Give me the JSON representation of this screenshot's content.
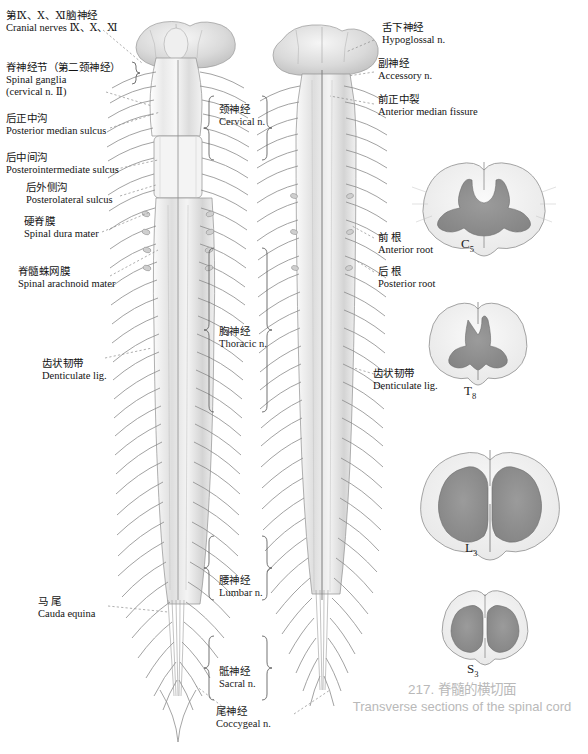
{
  "figure": {
    "caption_number_title_cn": "217. 脊髓的横切面",
    "caption_title_en": "Transverse sections of the spinal cord",
    "caption_color": "#b9b9b9"
  },
  "left_labels": [
    {
      "cn": "第Ⅸ、Ⅹ、Ⅺ脑神经",
      "en": "Cranial nerves Ⅸ、Ⅹ、Ⅺ"
    },
    {
      "cn": "脊神经节（第二颈神经）",
      "en": "Spinal ganglia",
      "en2": "(cervical n. Ⅱ)"
    },
    {
      "cn": "后正中沟",
      "en": "Posterior median sulcus"
    },
    {
      "cn": "后中间沟",
      "en": "Posterointermediate sulcus"
    },
    {
      "cn": "后外侧沟",
      "en": "Posterolateral sulcus"
    },
    {
      "cn": "硬脊膜",
      "en": "Spinal dura mater"
    },
    {
      "cn": "脊髓蛛网膜",
      "en": "Spinal arachnoid mater"
    },
    {
      "cn": "齿状韧带",
      "en": "Denticulate lig."
    },
    {
      "cn": "马  尾",
      "en": "Cauda equina"
    }
  ],
  "right_labels": [
    {
      "cn": "舌下神经",
      "en": "Hypoglossal n."
    },
    {
      "cn": "副神经",
      "en": "Accessory n."
    },
    {
      "cn": "前正中裂",
      "en": "Anterior median fissure"
    },
    {
      "cn": "前  根",
      "en": "Anterior root"
    },
    {
      "cn": "后  根",
      "en": "Posterior root"
    },
    {
      "cn": "齿状韧带",
      "en": "Denticulate lig."
    }
  ],
  "nerve_groups": [
    {
      "cn": "颈神经",
      "en": "Cervical n."
    },
    {
      "cn": "胸神经",
      "en": "Thoracic n."
    },
    {
      "cn": "腰神经",
      "en": "Lumbar n."
    },
    {
      "cn": "骶神经",
      "en": "Sacral n."
    },
    {
      "cn": "尾神经",
      "en": "Coccygeal n."
    }
  ],
  "cross_sections": [
    {
      "level": "C",
      "index": "5"
    },
    {
      "level": "T",
      "index": "8"
    },
    {
      "level": "L",
      "index": "3"
    },
    {
      "level": "S",
      "index": "3"
    }
  ]
}
